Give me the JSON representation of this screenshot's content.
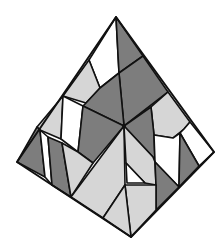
{
  "diagram": {
    "title": "",
    "colors": {
      "dark": "#7d7d7d",
      "light": "#d6d6d6",
      "white": "#ffffff",
      "stroke": "#111111"
    },
    "outline": "116,17 214,152 131,237 17,162",
    "pieces": [
      {
        "shade": "white",
        "points": "116,17 119,73 100,88 89,60"
      },
      {
        "shade": "dark",
        "points": "116,17 143,56 119,73"
      },
      {
        "shade": "light",
        "points": "89,60 100,88 86,103 63,96"
      },
      {
        "shade": "dark",
        "points": "119,73 143,56 168,92 124,126"
      },
      {
        "shade": "dark",
        "points": "100,88 119,73 124,126 83,106 86,103"
      },
      {
        "shade": "light",
        "points": "63,96 37,127 40,130 61,139"
      },
      {
        "shade": "white",
        "points": "63,96 83,106 78,152 61,139"
      },
      {
        "shade": "dark",
        "points": "83,106 124,126 93,163 78,152"
      },
      {
        "shade": "light",
        "points": "168,92 190,122 184,129 173,138 154,135 151,107"
      },
      {
        "shade": "dark",
        "points": "124,126 151,107 154,135 155,162 153,157"
      },
      {
        "shade": "white",
        "points": "190,122 214,152 199,166 180,133 184,129"
      },
      {
        "shade": "white",
        "points": "154,135 173,138 180,133 179,187 155,162"
      },
      {
        "shade": "dark",
        "points": "180,133 199,166 179,187"
      },
      {
        "shade": "dark",
        "points": "37,127 17,162 45,177 40,130"
      },
      {
        "shade": "white",
        "points": "40,130 48,137 52,185 45,177"
      },
      {
        "shade": "dark",
        "points": "48,137 62,143 71,197 52,185"
      },
      {
        "shade": "light",
        "points": "62,143 78,152 93,163 71,197"
      },
      {
        "shade": "light",
        "points": "124,126 125,185 103,218 71,197"
      },
      {
        "shade": "light",
        "points": "124,126 153,157 155,162 156,185 145,183 126,163"
      },
      {
        "shade": "white",
        "points": "126,163 145,183 127,183"
      },
      {
        "shade": "dark",
        "points": "155,162 179,187 156,210 156,185"
      },
      {
        "shade": "light",
        "points": "125,185 156,185 156,210 131,237"
      },
      {
        "shade": "light",
        "points": "125,185 131,237 103,218"
      }
    ],
    "center_vertex": {
      "x": 124,
      "y": 126
    }
  }
}
